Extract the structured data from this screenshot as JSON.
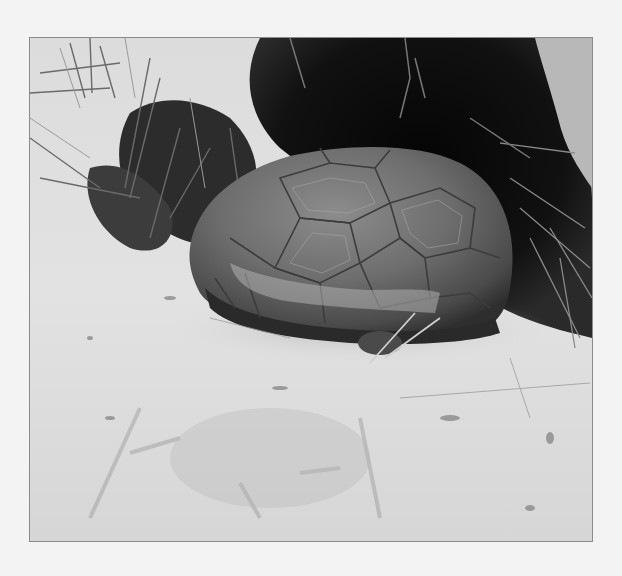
{
  "page": {
    "background": "#f3f3f3"
  },
  "photo": {
    "subject": "tortoise emerging from sandy burrow",
    "style": "grayscale photograph",
    "frame_border_color": "#8a8a8a",
    "colors": {
      "sand": "#d8d8d8",
      "sand_light": "#e6e6e6",
      "burrow": "#0c0c0c",
      "shell_light": "#9a9a9a",
      "shell_dark": "#3a3a3a"
    }
  }
}
